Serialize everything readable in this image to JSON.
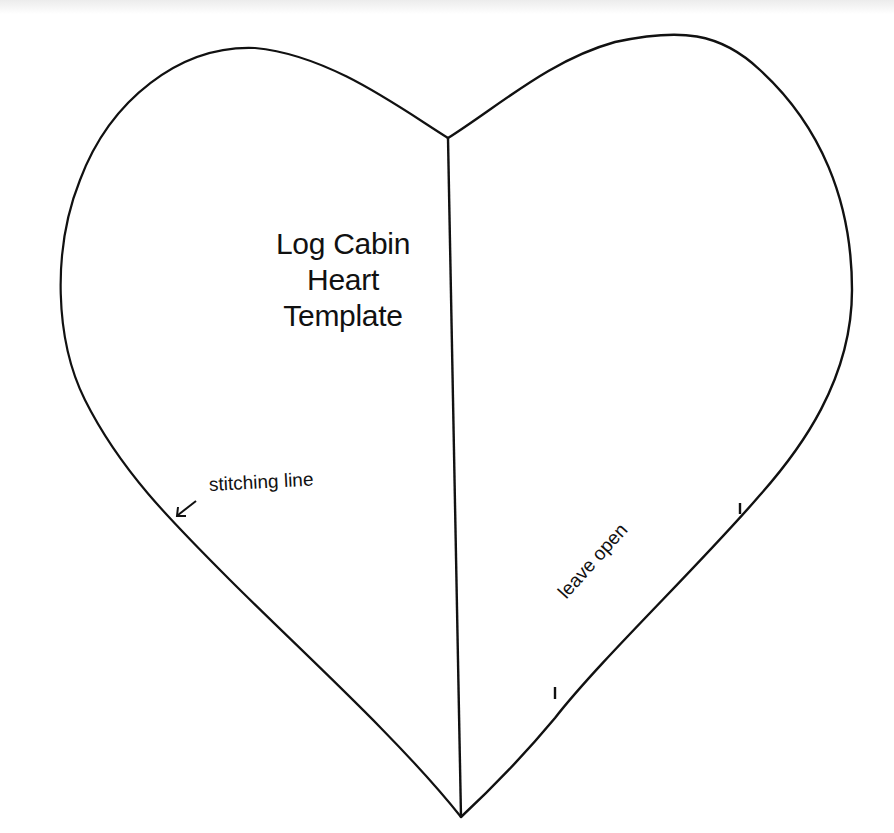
{
  "diagram": {
    "title_lines": [
      "Log Cabin",
      "Heart",
      "Template"
    ],
    "labels": {
      "stitching": "stitching line",
      "opening": "leave open"
    },
    "colors": {
      "stroke": "#111111",
      "background": "#ffffff"
    }
  }
}
